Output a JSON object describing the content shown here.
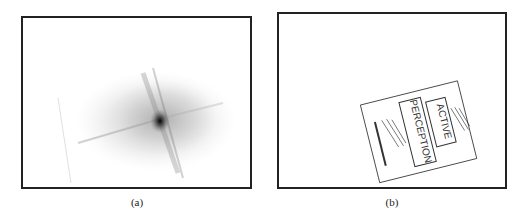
{
  "figure": {
    "panels": [
      {
        "id": "a",
        "caption": "(a)",
        "content": "spectrum-like grayscale blob with dark center and streaks"
      },
      {
        "id": "b",
        "caption": "(b)",
        "content": "edge-detected rotated book cover"
      }
    ],
    "book_cover": {
      "title_word_1": "ACTIVE",
      "title_word_2": "PERCEPTION"
    }
  }
}
